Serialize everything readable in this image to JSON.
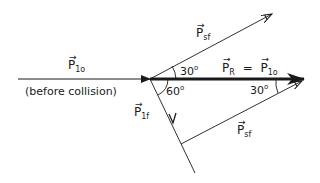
{
  "diagram": {
    "type": "vector-diagram",
    "labels": {
      "p1o": {
        "symbol": "P",
        "sub": "1o"
      },
      "before_collision": "(before collision)",
      "p1f": {
        "symbol": "P",
        "sub": "1f"
      },
      "psf_upper": {
        "symbol": "P",
        "sub": "sf"
      },
      "psf_lower": {
        "symbol": "P",
        "sub": "sf"
      },
      "resultant": {
        "symbol": "P",
        "sub": "R",
        "equals": "=",
        "symbol2": "P",
        "sub2": "1o"
      },
      "angle_upper": {
        "value": "30",
        "unit": "o"
      },
      "angle_lower_left": {
        "value": "60",
        "unit": "o"
      },
      "angle_right": {
        "value": "30",
        "unit": "o"
      }
    },
    "arrow_glyph": "→",
    "colors": {
      "ink": "#1a1a1a",
      "background": "#ffffff"
    }
  }
}
